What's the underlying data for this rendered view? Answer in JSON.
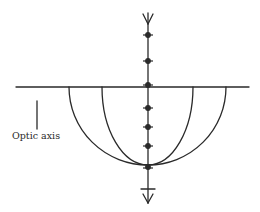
{
  "diagram": {
    "label": "Optic axis",
    "stroke_color": "#2a2a2a",
    "background": "#ffffff",
    "horizontal_line": {
      "x1": 16,
      "x2": 249,
      "y": 87
    },
    "optic_axis_marker": {
      "x": 37,
      "y1": 101,
      "y2": 129
    },
    "vertical_axis": {
      "x": 148,
      "y1": 13,
      "y2": 203
    },
    "top_arrow": {
      "direction": "down",
      "tip_y": 24
    },
    "bottom_arrow": {
      "direction": "down",
      "tip_y": 203
    },
    "bottom_tick_y": 189,
    "dots_y": [
      35,
      61,
      85,
      108,
      127,
      146,
      168
    ],
    "curves": [
      {
        "name": "outer-semicircle",
        "left_x": 69,
        "right_x": 226,
        "top_y": 87,
        "bottom_y": 165
      },
      {
        "name": "inner-semi-ellipse",
        "left_x": 102,
        "right_x": 193,
        "top_y": 87,
        "bottom_y": 165
      }
    ]
  }
}
